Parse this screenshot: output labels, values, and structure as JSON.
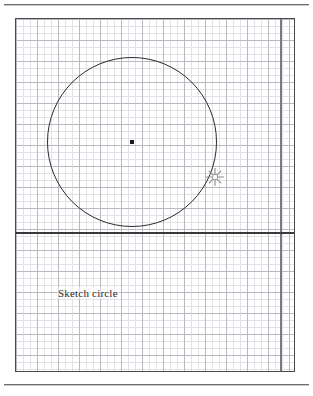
{
  "page": {
    "title": "Sketch circle",
    "background_color": "#ffffff",
    "rule_color": "#6d6d6d"
  },
  "canvas": {
    "name": "sketch-canvas",
    "x": 15,
    "y": 18,
    "width": 280,
    "height": 354,
    "border_color": "#4a4a4a",
    "grid": {
      "minor_spacing_px": 7,
      "minor_color": "#e2e2e8",
      "major_spacing_px": 21,
      "major_color": "#b9b9c2",
      "visible": true
    }
  },
  "construction_lines": {
    "horizontal_axis": {
      "name": "horizontal-construction-line",
      "y": 213,
      "color": "#3a3a3a",
      "thickness_px": 1.5
    },
    "vertical_axis": {
      "name": "vertical-construction-line",
      "x": 264,
      "color": "#7a7a84",
      "thickness_px": 1.5
    }
  },
  "geometry": {
    "circle": {
      "name": "sketched-circle",
      "center_x": 116,
      "center_y": 123,
      "radius": 85,
      "stroke_color": "#2b2b2b",
      "stroke_width_px": 1.4,
      "fill": "none"
    },
    "center_point": {
      "name": "circle-center-point",
      "x": 116,
      "y": 123,
      "size_px": 4,
      "color": "#1a1a1a"
    }
  },
  "cursor": {
    "name": "crosshair-cursor",
    "icon": "crosshair-pen-icon",
    "x": 199,
    "y": 158,
    "color": "#8a8a8a"
  },
  "caption": {
    "label": "Sketch circle",
    "x": 41,
    "y": 268,
    "color": "#2b2b2b",
    "font_size_px": 11
  }
}
